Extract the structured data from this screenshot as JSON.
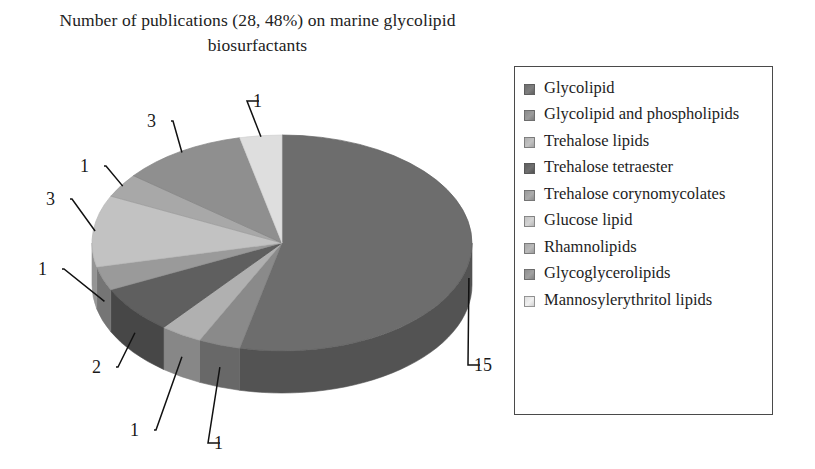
{
  "title": "Number of publications (28, 48%) on marine glycolipid biosurfactants",
  "chart_data": {
    "type": "pie",
    "title": "Number of publications (28, 48%) on marine glycolipid biosurfactants",
    "total": 28,
    "units": "publications",
    "three_d": true,
    "start_angle_deg": 0,
    "direction": "clockwise",
    "legend_position": "right",
    "grid": false,
    "categories": [
      "Glycolipid",
      "Glycolipid and phospholipids",
      "Trehalose lipids",
      "Trehalose tetraester",
      "Trehalose corynomycolates",
      "Glucose lipid",
      "Rhamnolipids",
      "Glycoglycerolipids",
      "Mannosylerythritol lipids"
    ],
    "values": [
      15,
      1,
      1,
      2,
      1,
      3,
      1,
      3,
      1
    ],
    "data_labels": [
      "15",
      "1",
      "1",
      "2",
      "1",
      "3",
      "1",
      "3",
      "1"
    ],
    "colors": [
      "#6d6d6d",
      "#8a8a8a",
      "#b0b0b0",
      "#5e5e5e",
      "#9a9a9a",
      "#c2c2c2",
      "#a8a8a8",
      "#8f8f8f",
      "#dedede"
    ],
    "side_colors": [
      "#525252",
      "#676767",
      "#878787",
      "#474747",
      "#757575",
      "#959595",
      "#808080",
      "#6c6c6c",
      "#aeaeae"
    ]
  },
  "legend": {
    "items": [
      {
        "label": "Glycolipid",
        "color": "#6d6d6d"
      },
      {
        "label": "Glycolipid and phospholipids",
        "color": "#8a8a8a"
      },
      {
        "label": "Trehalose lipids",
        "color": "#b0b0b0"
      },
      {
        "label": "Trehalose tetraester",
        "color": "#5e5e5e"
      },
      {
        "label": "Trehalose corynomycolates",
        "color": "#9a9a9a"
      },
      {
        "label": "Glucose lipid",
        "color": "#c2c2c2"
      },
      {
        "label": "Rhamnolipids",
        "color": "#a8a8a8"
      },
      {
        "label": "Glycoglycerolipids",
        "color": "#8f8f8f"
      },
      {
        "label": "Mannosylerythritol lipids",
        "color": "#dedede"
      }
    ]
  },
  "labels": [
    {
      "text": "1",
      "x": 253,
      "y": 92,
      "category": "Mannosylerythritol lipids"
    },
    {
      "text": "3",
      "x": 147,
      "y": 112,
      "category": "Glycoglycerolipids"
    },
    {
      "text": "1",
      "x": 80,
      "y": 157,
      "category": "Rhamnolipids"
    },
    {
      "text": "3",
      "x": 46,
      "y": 190,
      "category": "Glucose lipid"
    },
    {
      "text": "1",
      "x": 38,
      "y": 260,
      "category": "Trehalose corynomycolates"
    },
    {
      "text": "2",
      "x": 92,
      "y": 358,
      "category": "Trehalose tetraester"
    },
    {
      "text": "1",
      "x": 130,
      "y": 421,
      "category": "Trehalose lipids"
    },
    {
      "text": "1",
      "x": 214,
      "y": 434,
      "category": "Glycolipid and phospholipids"
    },
    {
      "text": "15",
      "x": 474,
      "y": 356,
      "category": "Glycolipid"
    }
  ]
}
